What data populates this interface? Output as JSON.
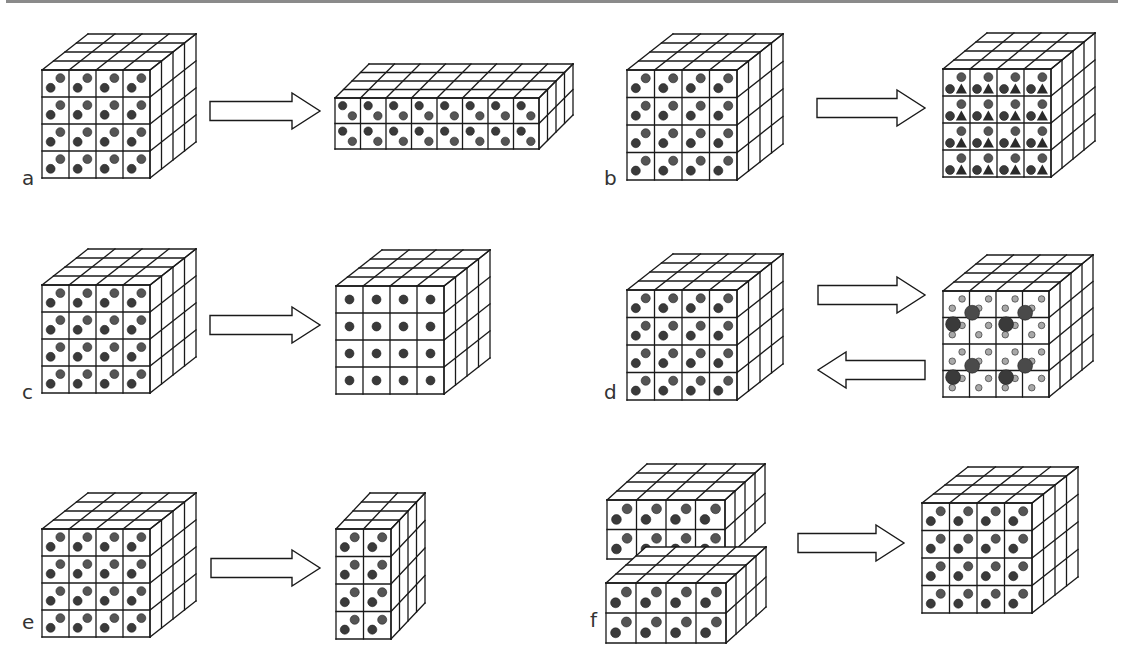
{
  "figure": {
    "title": "",
    "colors": {
      "line": "#1a1a1a",
      "dot_dark": "#3a3a3a",
      "dot_mid": "#555555",
      "dot_light": "#a8a8a8",
      "triangle": "#2a2a2a",
      "rule": "#8a8a8a"
    },
    "panels": [
      {
        "label": "a",
        "label_pos": [
          22,
          186
        ],
        "cubes": [
          {
            "x": 42,
            "y": 70,
            "cols": 4,
            "rows": 4,
            "depth": 4,
            "cell": 27,
            "dx": 11.5,
            "dy": -9,
            "pattern": "diag2"
          },
          {
            "x": 335,
            "y": 98,
            "cols": 8,
            "rows": 2,
            "depth": 4,
            "cell": 25.5,
            "dx": 8.5,
            "dy": -8.5,
            "pattern": "diag2b"
          }
        ],
        "arrows": [
          {
            "x1": 210,
            "x2": 320,
            "y": 111,
            "dir": "right"
          }
        ]
      },
      {
        "label": "b",
        "label_pos": [
          604,
          186
        ],
        "cubes": [
          {
            "x": 627,
            "y": 70,
            "cols": 4,
            "rows": 4,
            "depth": 4,
            "cell": 27.5,
            "dx": 11.5,
            "dy": -9,
            "pattern": "diag2"
          },
          {
            "x": 943,
            "y": 69,
            "cols": 4,
            "rows": 4,
            "depth": 4,
            "cell": 27,
            "dx": 11,
            "dy": -9,
            "pattern": "triad"
          }
        ],
        "arrows": [
          {
            "x1": 817,
            "x2": 925,
            "y": 108,
            "dir": "right"
          }
        ]
      },
      {
        "label": "c",
        "label_pos": [
          22,
          400
        ],
        "cubes": [
          {
            "x": 42,
            "y": 285,
            "cols": 4,
            "rows": 4,
            "depth": 4,
            "cell": 27,
            "dx": 11.5,
            "dy": -9,
            "pattern": "diag2"
          },
          {
            "x": 336,
            "y": 286,
            "cols": 4,
            "rows": 4,
            "depth": 4,
            "cell": 27,
            "dx": 11.5,
            "dy": -9,
            "pattern": "center"
          }
        ],
        "arrows": [
          {
            "x1": 210,
            "x2": 320,
            "y": 325,
            "dir": "right"
          }
        ]
      },
      {
        "label": "d",
        "label_pos": [
          604,
          400
        ],
        "cubes": [
          {
            "x": 627,
            "y": 290,
            "cols": 4,
            "rows": 4,
            "depth": 4,
            "cell": 27.5,
            "dx": 11.5,
            "dy": -9,
            "pattern": "diag2"
          },
          {
            "x": 943,
            "y": 291,
            "cols": 4,
            "rows": 4,
            "depth": 4,
            "cell": 26.5,
            "dx": 11,
            "dy": -9,
            "pattern": "cluster"
          }
        ],
        "arrows": [
          {
            "x1": 818,
            "x2": 925,
            "y": 295,
            "dir": "right"
          },
          {
            "x1": 818,
            "x2": 925,
            "y": 370,
            "dir": "left"
          }
        ]
      },
      {
        "label": "e",
        "label_pos": [
          22,
          630
        ],
        "cubes": [
          {
            "x": 42,
            "y": 529,
            "cols": 4,
            "rows": 4,
            "depth": 4,
            "cell": 27,
            "dx": 11.5,
            "dy": -9,
            "pattern": "diag2"
          },
          {
            "x": 336,
            "y": 529,
            "cols": 2,
            "rows": 4,
            "depth": 4,
            "cell": 27.5,
            "dx": 8.5,
            "dy": -9,
            "pattern": "diag2"
          }
        ],
        "arrows": [
          {
            "x1": 211,
            "x2": 320,
            "y": 568,
            "dir": "right"
          }
        ]
      },
      {
        "label": "f",
        "label_pos": [
          590,
          628
        ],
        "cubes": [
          {
            "x": 607,
            "y": 500,
            "cols": 4,
            "rows": 2,
            "depth": 4,
            "cell": 29.5,
            "dx": 10,
            "dy": -9,
            "pattern": "diag2"
          },
          {
            "x": 606,
            "y": 583,
            "cols": 4,
            "rows": 2,
            "depth": 4,
            "cell": 30,
            "dx": 10,
            "dy": -9,
            "pattern": "diag2"
          },
          {
            "x": 922,
            "y": 503,
            "cols": 4,
            "rows": 4,
            "depth": 4,
            "cell": 27.5,
            "dx": 11.5,
            "dy": -9,
            "pattern": "diag2"
          }
        ],
        "arrows": [
          {
            "x1": 798,
            "x2": 904,
            "y": 543,
            "dir": "right"
          }
        ]
      }
    ]
  }
}
